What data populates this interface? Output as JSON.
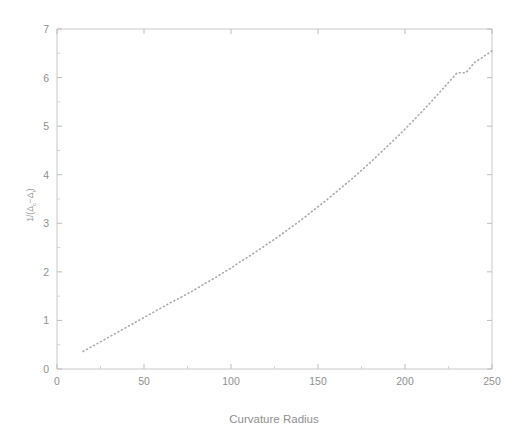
{
  "chart_data": {
    "type": "line",
    "title": "",
    "xlabel": "Curvature Radius",
    "ylabel": "1/(Δ_c − Δ_i)",
    "ylabel_plain": "1/(Ac-Ai)",
    "xlim": [
      0,
      250
    ],
    "ylim": [
      0,
      7
    ],
    "xticks": [
      0,
      50,
      100,
      150,
      200,
      250
    ],
    "yticks": [
      0,
      1,
      2,
      3,
      4,
      5,
      6,
      7
    ],
    "xtick_labels": [
      "0",
      "50",
      "100",
      "150",
      "200",
      "250"
    ],
    "ytick_labels": [
      "0",
      "1",
      "2",
      "3",
      "4",
      "5",
      "6",
      "7"
    ],
    "grid": false,
    "legend": null,
    "line_style": "dotted",
    "line_color": "#a8a8a8",
    "series": [
      {
        "name": "inverse gap",
        "x": [
          15,
          20,
          25,
          30,
          35,
          40,
          45,
          50,
          55,
          60,
          65,
          70,
          75,
          80,
          85,
          90,
          95,
          100,
          105,
          110,
          115,
          120,
          125,
          130,
          135,
          140,
          145,
          150,
          155,
          160,
          165,
          170,
          175,
          180,
          185,
          190,
          195,
          200,
          205,
          210,
          215,
          220,
          225,
          230,
          235,
          240,
          245,
          250
        ],
        "y": [
          0.36,
          0.46,
          0.56,
          0.66,
          0.76,
          0.86,
          0.96,
          1.06,
          1.16,
          1.26,
          1.36,
          1.45,
          1.55,
          1.65,
          1.76,
          1.86,
          1.97,
          2.08,
          2.2,
          2.31,
          2.43,
          2.55,
          2.67,
          2.8,
          2.93,
          3.06,
          3.2,
          3.34,
          3.48,
          3.63,
          3.78,
          3.93,
          4.09,
          4.25,
          4.42,
          4.59,
          4.76,
          4.94,
          5.12,
          5.31,
          5.5,
          5.7,
          5.9,
          6.1,
          6.1,
          6.31,
          6.43,
          6.55
        ]
      }
    ]
  },
  "axes": {
    "x_axis_label": "Curvature Radius",
    "y_axis_label_parts": {
      "prefix": "1/(",
      "delta1": "Δ",
      "sub1": "c",
      "minus": "−",
      "delta2": "Δ",
      "sub2": "i",
      "suffix": ")"
    }
  },
  "colors": {
    "background": "#ffffff",
    "frame": "#c8c8c8",
    "text": "#8f8f8f",
    "curve": "#a8a8a8"
  }
}
